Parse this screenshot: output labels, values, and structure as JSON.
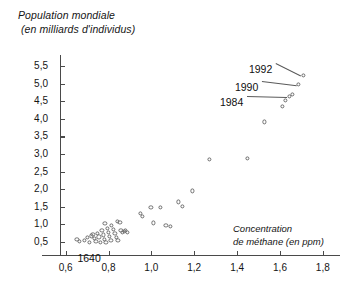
{
  "chart_data": {
    "type": "scatter",
    "title": "",
    "ylabel_line1": "Population mondiale",
    "ylabel_line2": "(en milliards d'individus)",
    "xlabel_line1": "Concentration",
    "xlabel_line2": "de méthane (en ppm)",
    "xlabel": "Concentration de méthane (en ppm)",
    "ylabel": "Population mondiale (en milliards d'individus)",
    "xlim": [
      0.49,
      1.88
    ],
    "ylim": [
      0.12,
      5.82
    ],
    "xticks": [
      0.6,
      0.8,
      1.0,
      1.2,
      1.4,
      1.6,
      1.8
    ],
    "yticks": [
      0.5,
      1.0,
      1.5,
      2.0,
      2.5,
      3.0,
      3.5,
      4.0,
      4.5,
      5.0,
      5.5
    ],
    "xticklabels": [
      "0,6",
      "0,8",
      "1,0",
      "1,2",
      "1,4",
      "1,6",
      "1,8"
    ],
    "yticklabels": [
      "0,5",
      "1,0",
      "1,5",
      "2,0",
      "2,5",
      "3,0",
      "3,5",
      "4,0",
      "4,5",
      "5,0",
      "5,5"
    ],
    "grid": false,
    "legend": null,
    "marker": "open-circle",
    "marker_color": "#6b6b6b",
    "points": [
      {
        "x": 0.655,
        "y": 0.56
      },
      {
        "x": 0.668,
        "y": 0.5
      },
      {
        "x": 0.69,
        "y": 0.53
      },
      {
        "x": 0.703,
        "y": 0.6
      },
      {
        "x": 0.712,
        "y": 0.47
      },
      {
        "x": 0.722,
        "y": 0.65
      },
      {
        "x": 0.73,
        "y": 0.7
      },
      {
        "x": 0.737,
        "y": 0.58
      },
      {
        "x": 0.744,
        "y": 0.5
      },
      {
        "x": 0.752,
        "y": 0.73
      },
      {
        "x": 0.758,
        "y": 0.62
      },
      {
        "x": 0.764,
        "y": 0.47
      },
      {
        "x": 0.772,
        "y": 0.8
      },
      {
        "x": 0.778,
        "y": 0.68
      },
      {
        "x": 0.783,
        "y": 0.55
      },
      {
        "x": 0.79,
        "y": 0.46
      },
      {
        "x": 0.797,
        "y": 0.86
      },
      {
        "x": 0.803,
        "y": 0.74
      },
      {
        "x": 0.808,
        "y": 0.63
      },
      {
        "x": 0.814,
        "y": 0.52
      },
      {
        "x": 0.786,
        "y": 1.01
      },
      {
        "x": 0.815,
        "y": 0.96
      },
      {
        "x": 0.826,
        "y": 0.84
      },
      {
        "x": 0.832,
        "y": 0.72
      },
      {
        "x": 0.838,
        "y": 0.6
      },
      {
        "x": 0.846,
        "y": 0.52
      },
      {
        "x": 0.856,
        "y": 1.04
      },
      {
        "x": 0.86,
        "y": 0.8
      },
      {
        "x": 0.866,
        "y": 0.74
      },
      {
        "x": 0.875,
        "y": 0.78
      },
      {
        "x": 0.883,
        "y": 0.8
      },
      {
        "x": 0.892,
        "y": 0.76
      },
      {
        "x": 0.844,
        "y": 1.07
      },
      {
        "x": 0.95,
        "y": 1.3
      },
      {
        "x": 0.962,
        "y": 1.21
      },
      {
        "x": 1.0,
        "y": 1.47
      },
      {
        "x": 1.045,
        "y": 1.46
      },
      {
        "x": 1.013,
        "y": 1.02
      },
      {
        "x": 1.07,
        "y": 0.95
      },
      {
        "x": 1.09,
        "y": 0.93
      },
      {
        "x": 1.13,
        "y": 1.62
      },
      {
        "x": 1.148,
        "y": 1.5
      },
      {
        "x": 1.195,
        "y": 1.93
      },
      {
        "x": 1.273,
        "y": 2.82
      },
      {
        "x": 1.45,
        "y": 2.85
      },
      {
        "x": 1.53,
        "y": 3.9
      },
      {
        "x": 1.612,
        "y": 4.35
      },
      {
        "x": 1.628,
        "y": 4.52
      },
      {
        "x": 1.648,
        "y": 4.62
      },
      {
        "x": 1.662,
        "y": 4.68
      },
      {
        "x": 1.69,
        "y": 4.96
      },
      {
        "x": 1.712,
        "y": 5.22
      }
    ],
    "annotations": [
      {
        "label": "1992",
        "x": 1.712,
        "y": 5.22,
        "text_x": 1.455,
        "text_y": 5.38
      },
      {
        "label": "1990",
        "x": 1.69,
        "y": 4.96,
        "text_x": 1.39,
        "text_y": 4.88
      },
      {
        "label": "1984",
        "x": 1.648,
        "y": 4.62,
        "text_x": 1.32,
        "text_y": 4.45
      },
      {
        "label": "1640",
        "x": 0.672,
        "y": 0.5,
        "text_x": 0.655,
        "text_y": 0.22
      }
    ]
  }
}
